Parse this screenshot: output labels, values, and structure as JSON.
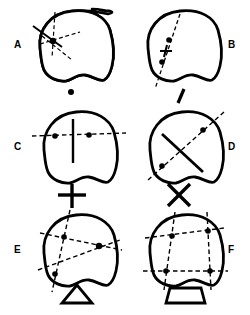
{
  "figure": {
    "background_color": "#ffffff",
    "stroke_color": "#000000",
    "panel_count": 6,
    "columns": 2,
    "rows": 3
  },
  "panels": [
    {
      "id": "A",
      "label": "A",
      "label_position": "left",
      "construction": "pencil-of-lines-through-point",
      "description": "Four dashed lines radiating from one common marked point inside the blob",
      "marked_points": 1,
      "dashed_lines": 4,
      "solid_lines": 0,
      "symbol": {
        "name": "point-symbol",
        "glyph": "dot",
        "description": "single filled dot"
      }
    },
    {
      "id": "B",
      "label": "B",
      "label_position": "right",
      "construction": "single-line-with-two-points",
      "description": "One dashed diagonal line carrying two marked points and a tick cross",
      "marked_points": 2,
      "dashed_lines": 1,
      "solid_lines": 0,
      "symbol": {
        "name": "line-symbol",
        "glyph": "slash",
        "description": "single slanted line segment"
      }
    },
    {
      "id": "C",
      "label": "C",
      "label_position": "left",
      "construction": "perpendicular-axes-two-points",
      "description": "Horizontal dashed line with two marked points crossed by a vertical solid line",
      "marked_points": 2,
      "dashed_lines": 1,
      "solid_lines": 1,
      "symbol": {
        "name": "plus-symbol",
        "glyph": "+",
        "description": "upright cross / plus sign"
      }
    },
    {
      "id": "D",
      "label": "D",
      "label_position": "right",
      "construction": "oblique-axes-two-points",
      "description": "Diagonal dashed line with two marked points crossed by an oblique solid line",
      "marked_points": 2,
      "dashed_lines": 1,
      "solid_lines": 1,
      "symbol": {
        "name": "cross-symbol",
        "glyph": "X",
        "description": "oblique cross / X shape"
      }
    },
    {
      "id": "E",
      "label": "E",
      "label_position": "left",
      "construction": "triangle-three-points",
      "description": "Three dashed lines meeting pairwise at three marked points forming a triangle",
      "marked_points": 3,
      "dashed_lines": 3,
      "solid_lines": 0,
      "symbol": {
        "name": "triangle-symbol",
        "glyph": "triangle",
        "description": "open triangle outline"
      }
    },
    {
      "id": "F",
      "label": "F",
      "label_position": "right",
      "construction": "quadrilateral-four-points",
      "description": "Four dashed lines meeting at four marked points forming a quadrilateral",
      "marked_points": 4,
      "dashed_lines": 4,
      "solid_lines": 0,
      "symbol": {
        "name": "trapezoid-symbol",
        "glyph": "trapezoid",
        "description": "open trapezoid outline"
      }
    }
  ]
}
